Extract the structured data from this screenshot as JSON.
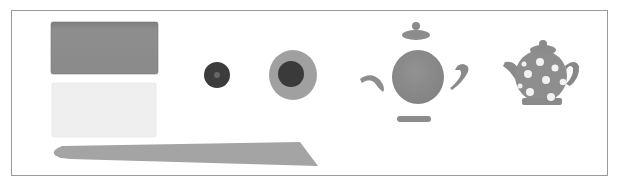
{
  "image": {
    "description": "Grayscale step illustration: clay slabs, tool, discs, teapot parts, assembled polka-dot teapot",
    "colors": {
      "frame_border": "#9a9a9a",
      "clay_dark": "#8c8c8c",
      "clay_light": "#ededed",
      "tool": "#a6a6a6",
      "disc_dark": "#3a3a3a",
      "disc_ring": "#9e9e9e",
      "teapot_body": "#8e8e8e",
      "dots": "#f0f0f0"
    },
    "items": [
      {
        "name": "grey-clay-block"
      },
      {
        "name": "white-clay-block"
      },
      {
        "name": "modelling-tool"
      },
      {
        "name": "small-dark-disc"
      },
      {
        "name": "disc-with-ring"
      },
      {
        "name": "teapot-parts"
      },
      {
        "name": "assembled-teapot"
      }
    ]
  }
}
